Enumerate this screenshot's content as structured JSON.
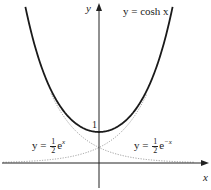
{
  "chart_data": {
    "type": "line",
    "title": "",
    "xlabel": "x",
    "ylabel": "y",
    "xlim": [
      -3.1,
      3.4
    ],
    "ylim": [
      -0.9,
      5.1
    ],
    "grid": false,
    "legend": "none (inline curve labels)",
    "annotations": [
      {
        "text": "y = cosh x",
        "position": "top-right"
      },
      {
        "text": "y = ½eˣ",
        "position": "lower-left"
      },
      {
        "text": "y = ½e⁻ˣ",
        "position": "lower-right"
      },
      {
        "text": "1",
        "position": "y-intercept of cosh x at (0,1)"
      }
    ],
    "series": [
      {
        "name": "y = cosh x",
        "style": "solid thick black",
        "x": [
          -2.3,
          -2.0,
          -1.5,
          -1.0,
          -0.5,
          0,
          0.5,
          1.0,
          1.5,
          2.0,
          2.3
        ],
        "y": [
          5.04,
          3.76,
          2.35,
          1.54,
          1.13,
          1.0,
          1.13,
          1.54,
          2.35,
          3.76,
          5.04
        ]
      },
      {
        "name": "y = ½eˣ",
        "style": "dotted grey",
        "x": [
          -3.0,
          -2.0,
          -1.0,
          0,
          0.5,
          1.0,
          1.5
        ],
        "y": [
          0.02,
          0.07,
          0.18,
          0.5,
          0.82,
          1.36,
          2.24
        ]
      },
      {
        "name": "y = ½e⁻ˣ",
        "style": "dotted grey",
        "x": [
          -1.5,
          -1.0,
          -0.5,
          0,
          1.0,
          2.0,
          3.0
        ],
        "y": [
          2.24,
          1.36,
          0.82,
          0.5,
          0.18,
          0.07,
          0.02
        ]
      }
    ]
  },
  "labels": {
    "y_axis": "y",
    "x_axis": "x",
    "cosh_label": "y = cosh x",
    "one": "1",
    "left_prefix": "y =",
    "left_num": "1",
    "left_den": "2",
    "left_e": "e",
    "left_exp": "x",
    "right_prefix": "y =",
    "right_num": "1",
    "right_den": "2",
    "right_e": "e",
    "right_exp": "−x"
  }
}
